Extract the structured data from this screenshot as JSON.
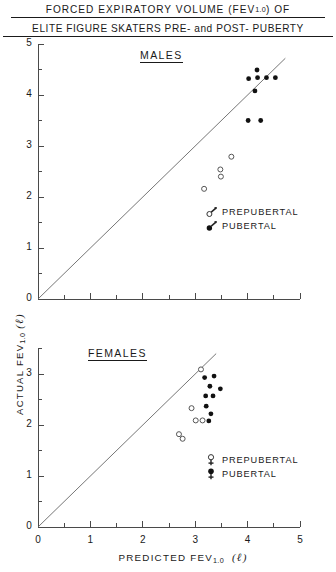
{
  "figure": {
    "title_line_1": "FORCED EXPIRATORY VOLUME (FEV",
    "title_line_1_sub": "1.0",
    "title_line_1_end": ") OF",
    "title_line_2": "ELITE FIGURE SKATERS PRE- and POST- PUBERTY",
    "axis": {
      "y_label_prefix": "ACTUAL  FEV",
      "y_label_sub": "1.0",
      "y_label_unit": "(ℓ)",
      "x_label_prefix": "PREDICTED  FEV",
      "x_label_sub": "1.0",
      "x_label_unit": "(ℓ)"
    },
    "panels": [
      {
        "id": "males",
        "label": "MALES",
        "legend": [
          {
            "symbol": "male-open",
            "label": "PREPUBERTAL"
          },
          {
            "symbol": "male-filled",
            "label": "PUBERTAL"
          }
        ]
      },
      {
        "id": "females",
        "label": "FEMALES",
        "legend": [
          {
            "symbol": "female-open",
            "label": "PREPUBERTAL"
          },
          {
            "symbol": "female-filled",
            "label": "PUBERTAL"
          }
        ]
      }
    ]
  },
  "chart_data": [
    {
      "id": "males",
      "type": "scatter",
      "title": "MALES",
      "xlabel": "PREDICTED FEV1.0 (ℓ)",
      "ylabel": "ACTUAL FEV1.0 (ℓ)",
      "xlim": [
        0,
        5
      ],
      "ylim": [
        0,
        5
      ],
      "xticks": [
        0,
        1,
        2,
        3,
        4,
        5
      ],
      "yticks": [
        0,
        1,
        2,
        3,
        4,
        5
      ],
      "xtick_labels": [
        "0",
        "1",
        "2",
        "3",
        "4",
        "5"
      ],
      "ytick_labels": [
        "0",
        "1",
        "2",
        "3",
        "4",
        "5"
      ],
      "minor_tick_step": 0.5,
      "grid": false,
      "legend_position": "lower-right-inside",
      "reference_line": {
        "name": "identity",
        "equation": "y = x",
        "x_start": 0.0,
        "y_start": 0.0,
        "x_end": 4.72,
        "y_end": 4.72
      },
      "series": [
        {
          "name": "PUBERTAL",
          "marker": "filled-circle",
          "color": "#111111",
          "points": [
            {
              "x": 4.18,
              "y": 4.49
            },
            {
              "x": 4.02,
              "y": 4.32
            },
            {
              "x": 4.19,
              "y": 4.34
            },
            {
              "x": 4.36,
              "y": 4.34
            },
            {
              "x": 4.53,
              "y": 4.34
            },
            {
              "x": 4.14,
              "y": 4.08
            },
            {
              "x": 4.01,
              "y": 3.5
            },
            {
              "x": 4.25,
              "y": 3.5
            }
          ]
        },
        {
          "name": "PREPUBERTAL",
          "marker": "open-circle",
          "color": "#555555",
          "points": [
            {
              "x": 3.69,
              "y": 2.79
            },
            {
              "x": 3.48,
              "y": 2.54
            },
            {
              "x": 3.49,
              "y": 2.4
            },
            {
              "x": 3.17,
              "y": 2.16
            }
          ]
        }
      ]
    },
    {
      "id": "females",
      "type": "scatter",
      "title": "FEMALES",
      "xlabel": "PREDICTED FEV1.0 (ℓ)",
      "ylabel": "ACTUAL FEV1.0 (ℓ)",
      "xlim": [
        0,
        5
      ],
      "ylim": [
        0,
        3.5
      ],
      "xticks": [
        0,
        1,
        2,
        3,
        4,
        5
      ],
      "yticks": [
        0,
        1,
        2,
        3
      ],
      "xtick_labels": [
        "0",
        "1",
        "2",
        "3",
        "4",
        "5"
      ],
      "ytick_labels": [
        "0",
        "1",
        "2",
        "3"
      ],
      "minor_tick_step": 0.5,
      "grid": false,
      "legend_position": "lower-right-inside",
      "reference_line": {
        "name": "identity",
        "equation": "y = x",
        "x_start": 0.0,
        "y_start": 0.0,
        "x_end": 3.4,
        "y_end": 3.4
      },
      "series": [
        {
          "name": "PUBERTAL",
          "marker": "filled-circle",
          "color": "#111111",
          "points": [
            {
              "x": 3.18,
              "y": 2.93
            },
            {
              "x": 3.36,
              "y": 2.96
            },
            {
              "x": 3.28,
              "y": 2.76
            },
            {
              "x": 3.48,
              "y": 2.71
            },
            {
              "x": 3.2,
              "y": 2.57
            },
            {
              "x": 3.34,
              "y": 2.57
            },
            {
              "x": 3.21,
              "y": 2.37
            },
            {
              "x": 3.3,
              "y": 2.22
            },
            {
              "x": 3.26,
              "y": 2.08
            }
          ]
        },
        {
          "name": "PREPUBERTAL",
          "marker": "open-circle",
          "color": "#555555",
          "points": [
            {
              "x": 3.11,
              "y": 3.09
            },
            {
              "x": 2.93,
              "y": 2.33
            },
            {
              "x": 3.01,
              "y": 2.09
            },
            {
              "x": 3.14,
              "y": 2.09
            },
            {
              "x": 2.69,
              "y": 1.82
            },
            {
              "x": 2.76,
              "y": 1.73
            }
          ]
        }
      ]
    }
  ]
}
